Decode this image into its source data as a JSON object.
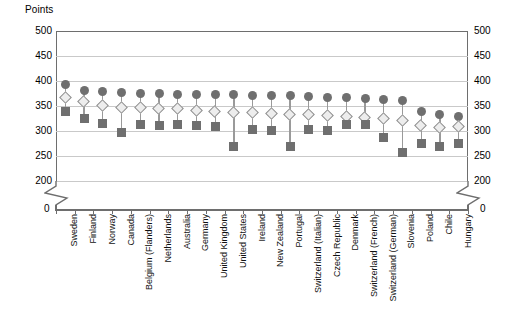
{
  "chart": {
    "axis_title": "Points",
    "zero_label": "0",
    "y_ticks": [
      "500",
      "450",
      "400",
      "350",
      "300",
      "250",
      "200"
    ],
    "y_tick_values": [
      500,
      450,
      400,
      350,
      300,
      250,
      200
    ]
  },
  "chart_data": {
    "type": "scatter",
    "title": "Points",
    "xlabel": "",
    "ylabel": "Points",
    "ylim": [
      200,
      500
    ],
    "axis_break": true,
    "grid": true,
    "legend": "none",
    "categories": [
      "Sweden",
      "Finland",
      "Norway",
      "Canada",
      "Belgium (Flanders)",
      "Netherlands",
      "Australia",
      "Germany",
      "United Kingdom",
      "United States",
      "Ireland",
      "New Zealand",
      "Portugal",
      "Switzerland (Italian)",
      "Czech Republic",
      "Denmark",
      "Switzerland (French)",
      "Switzerland (German)",
      "Slovenia",
      "Poland",
      "Chile",
      "Hungary"
    ],
    "series": [
      {
        "name": "upper",
        "marker": "circle",
        "values": [
          331,
          320,
          317,
          316,
          314,
          313,
          312,
          312,
          311,
          311,
          310,
          310,
          309,
          308,
          306,
          305,
          304,
          302,
          300,
          278,
          272,
          268
        ]
      },
      {
        "name": "middle",
        "marker": "diamond",
        "values": [
          304,
          297,
          288,
          285,
          285,
          283,
          282,
          279,
          277,
          275,
          274,
          273,
          271,
          270,
          268,
          266,
          264,
          262,
          259,
          249,
          244,
          247
        ]
      },
      {
        "name": "lower",
        "marker": "square",
        "values": [
          277,
          263,
          253,
          236,
          251,
          250,
          251,
          250,
          247,
          207,
          242,
          240,
          208,
          241,
          240,
          251,
          251,
          226,
          196,
          214,
          208,
          213
        ]
      }
    ]
  }
}
